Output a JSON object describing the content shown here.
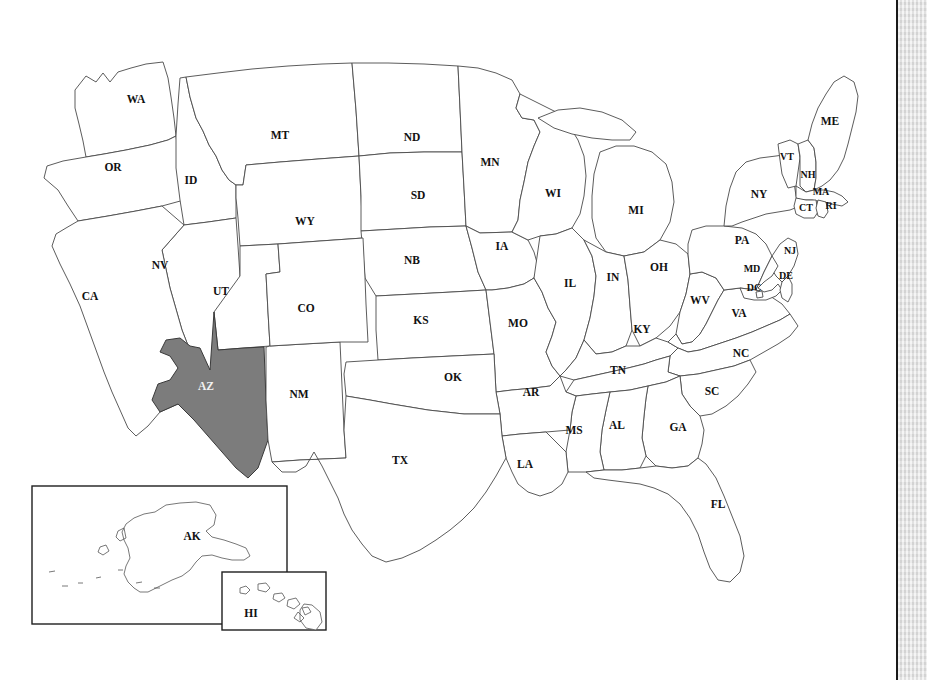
{
  "document": {
    "title": "United States State Map",
    "subtitle": "Arizona highlighted",
    "background_color": "#ffffff",
    "page_edge_color": "#e3e3e3",
    "page_edge_line_color": "#1a1a1a"
  },
  "map": {
    "projection_note": "contiguous United States with Alaska and Hawaii insets",
    "outline_color": "#4a4a4a",
    "state_fill": "#ffffff",
    "highlight_fill": "#7c7c7c",
    "highlight_label_color": "#f2f2f2",
    "label_color": "#111111",
    "highlighted_states": [
      "AZ"
    ],
    "states": [
      {
        "code": "WA",
        "name": "Washington",
        "x": 136,
        "y": 100,
        "highlighted": false
      },
      {
        "code": "OR",
        "name": "Oregon",
        "x": 113,
        "y": 168,
        "highlighted": false
      },
      {
        "code": "ID",
        "name": "Idaho",
        "x": 191,
        "y": 181,
        "highlighted": false
      },
      {
        "code": "MT",
        "name": "Montana",
        "x": 280,
        "y": 136,
        "highlighted": false
      },
      {
        "code": "WY",
        "name": "Wyoming",
        "x": 305,
        "y": 222,
        "highlighted": false
      },
      {
        "code": "ND",
        "name": "North Dakota",
        "x": 412,
        "y": 138,
        "highlighted": false
      },
      {
        "code": "SD",
        "name": "South Dakota",
        "x": 418,
        "y": 196,
        "highlighted": false
      },
      {
        "code": "NB",
        "name": "Nebraska",
        "x": 412,
        "y": 261,
        "highlighted": false
      },
      {
        "code": "MN",
        "name": "Minnesota",
        "x": 490,
        "y": 163,
        "highlighted": false
      },
      {
        "code": "IA",
        "name": "Iowa",
        "x": 502,
        "y": 247,
        "highlighted": false
      },
      {
        "code": "WI",
        "name": "Wisconsin",
        "x": 553,
        "y": 194,
        "highlighted": false
      },
      {
        "code": "MI",
        "name": "Michigan",
        "x": 636,
        "y": 211,
        "highlighted": false
      },
      {
        "code": "NV",
        "name": "Nevada",
        "x": 160,
        "y": 266,
        "highlighted": false
      },
      {
        "code": "UT",
        "name": "Utah",
        "x": 221,
        "y": 292,
        "highlighted": false
      },
      {
        "code": "CA",
        "name": "California",
        "x": 90,
        "y": 297,
        "highlighted": false
      },
      {
        "code": "CO",
        "name": "Colorado",
        "x": 306,
        "y": 309,
        "highlighted": false
      },
      {
        "code": "KS",
        "name": "Kansas",
        "x": 421,
        "y": 321,
        "highlighted": false
      },
      {
        "code": "MO",
        "name": "Missouri",
        "x": 518,
        "y": 324,
        "highlighted": false
      },
      {
        "code": "IL",
        "name": "Illinois",
        "x": 570,
        "y": 284,
        "highlighted": false
      },
      {
        "code": "IN",
        "name": "Indiana",
        "x": 613,
        "y": 278,
        "highlighted": false
      },
      {
        "code": "OH",
        "name": "Ohio",
        "x": 659,
        "y": 268,
        "highlighted": false
      },
      {
        "code": "KY",
        "name": "Kentucky",
        "x": 642,
        "y": 330,
        "highlighted": false
      },
      {
        "code": "WV",
        "name": "West Virginia",
        "x": 700,
        "y": 301,
        "highlighted": false
      },
      {
        "code": "VA",
        "name": "Virginia",
        "x": 739,
        "y": 314,
        "highlighted": false
      },
      {
        "code": "NC",
        "name": "North Carolina",
        "x": 741,
        "y": 354,
        "highlighted": false
      },
      {
        "code": "TN",
        "name": "Tennessee",
        "x": 618,
        "y": 371,
        "highlighted": false
      },
      {
        "code": "SC",
        "name": "South Carolina",
        "x": 712,
        "y": 392,
        "highlighted": false
      },
      {
        "code": "AZ",
        "name": "Arizona",
        "x": 206,
        "y": 387,
        "highlighted": true
      },
      {
        "code": "NM",
        "name": "New Mexico",
        "x": 299,
        "y": 395,
        "highlighted": false
      },
      {
        "code": "OK",
        "name": "Oklahoma",
        "x": 453,
        "y": 378,
        "highlighted": false
      },
      {
        "code": "AR",
        "name": "Arkansas",
        "x": 531,
        "y": 393,
        "highlighted": false
      },
      {
        "code": "MS",
        "name": "Mississippi",
        "x": 574,
        "y": 431,
        "highlighted": false
      },
      {
        "code": "AL",
        "name": "Alabama",
        "x": 617,
        "y": 426,
        "highlighted": false
      },
      {
        "code": "GA",
        "name": "Georgia",
        "x": 678,
        "y": 428,
        "highlighted": false
      },
      {
        "code": "TX",
        "name": "Texas",
        "x": 400,
        "y": 461,
        "highlighted": false
      },
      {
        "code": "LA",
        "name": "Louisiana",
        "x": 525,
        "y": 465,
        "highlighted": false
      },
      {
        "code": "FL",
        "name": "Florida",
        "x": 718,
        "y": 505,
        "highlighted": false
      },
      {
        "code": "PA",
        "name": "Pennsylvania",
        "x": 742,
        "y": 241,
        "highlighted": false
      },
      {
        "code": "NY",
        "name": "New York",
        "x": 759,
        "y": 195,
        "highlighted": false
      },
      {
        "code": "ME",
        "name": "Maine",
        "x": 830,
        "y": 122,
        "highlighted": false
      },
      {
        "code": "VT",
        "name": "Vermont",
        "x": 787,
        "y": 158,
        "highlighted": false
      },
      {
        "code": "NH",
        "name": "New Hampshire",
        "x": 808,
        "y": 176,
        "highlighted": false
      },
      {
        "code": "MA",
        "name": "Massachusetts",
        "x": 821,
        "y": 193,
        "highlighted": false
      },
      {
        "code": "CT",
        "name": "Connecticut",
        "x": 806,
        "y": 209,
        "highlighted": false
      },
      {
        "code": "RI",
        "name": "Rhode Island",
        "x": 831,
        "y": 207,
        "highlighted": false
      },
      {
        "code": "NJ",
        "name": "New Jersey",
        "x": 790,
        "y": 252,
        "highlighted": false
      },
      {
        "code": "MD",
        "name": "Maryland",
        "x": 752,
        "y": 270,
        "highlighted": false
      },
      {
        "code": "DE",
        "name": "Delaware",
        "x": 786,
        "y": 277,
        "highlighted": false
      },
      {
        "code": "DC",
        "name": "Dist. of Columbia",
        "x": 754,
        "y": 289,
        "highlighted": false
      }
    ],
    "insets": [
      {
        "code": "AK",
        "name": "Alaska",
        "label_x": 192,
        "label_y": 537,
        "frame": {
          "x": 32,
          "y": 486,
          "width": 255,
          "height": 138
        }
      },
      {
        "code": "HI",
        "name": "Hawaii",
        "label_x": 251,
        "label_y": 614,
        "frame": {
          "x": 222,
          "y": 572,
          "width": 104,
          "height": 58
        }
      }
    ]
  }
}
